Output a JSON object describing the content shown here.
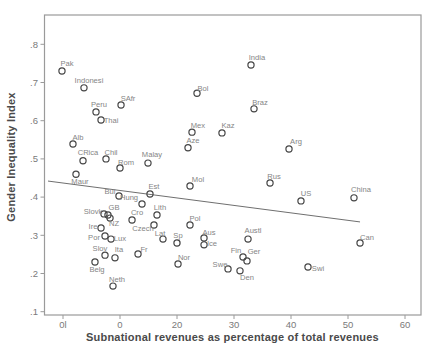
{
  "colors": {
    "background": "#ffffff",
    "frame": "#9a9a9a",
    "tick_text": "#7a7a7a",
    "marker_stroke": "#454545",
    "country_label_text": "#858585",
    "axis_title_text": "#4a4a4a",
    "trend_line": "#6f6f6f"
  },
  "chart_data": {
    "type": "scatter",
    "title": "",
    "xlabel": "Subnational revenues as percentage of total revenues",
    "ylabel": "Gender Inequality Index",
    "xlim": [
      -3.2,
      62.8
    ],
    "ylim": [
      0.09,
      0.88
    ],
    "grid": false,
    "legend": "none",
    "marker_style": "hollow-circle",
    "xticks": [
      {
        "value": 0,
        "label": "0l"
      },
      {
        "value": 10,
        "label": "0"
      },
      {
        "value": 20,
        "label": "20"
      },
      {
        "value": 30,
        "label": "30"
      },
      {
        "value": 40,
        "label": "40"
      },
      {
        "value": 50,
        "label": "50"
      },
      {
        "value": 60,
        "label": "60"
      }
    ],
    "yticks": [
      {
        "value": 0.1,
        "label": ".1"
      },
      {
        "value": 0.2,
        "label": ".2"
      },
      {
        "value": 0.3,
        "label": ".3"
      },
      {
        "value": 0.4,
        "label": ".4"
      },
      {
        "value": 0.5,
        "label": ".5"
      },
      {
        "value": 0.6,
        "label": ".6"
      },
      {
        "value": 0.7,
        "label": ".7"
      },
      {
        "value": 0.8,
        "label": ".8"
      }
    ],
    "trend_line": {
      "x1": -2.63,
      "y1": 0.442,
      "x2": 52.11,
      "y2": 0.335
    },
    "points": [
      {
        "label": "Pak",
        "x": -0.18,
        "y": 0.73,
        "ldx": 5,
        "ldy": -8
      },
      {
        "label": "Indonesi",
        "x": 3.68,
        "y": 0.686,
        "ldx": 5,
        "ldy": -7
      },
      {
        "label": "SAfr",
        "x": 10.18,
        "y": 0.641,
        "ldx": 7,
        "ldy": -7
      },
      {
        "label": "Peru",
        "x": 5.79,
        "y": 0.623,
        "ldx": 3,
        "ldy": -8
      },
      {
        "label": "Thai",
        "x": 6.67,
        "y": 0.602,
        "ldx": 10,
        "ldy": 0
      },
      {
        "label": "Alb",
        "x": 1.75,
        "y": 0.539,
        "ldx": 5,
        "ldy": -7
      },
      {
        "label": "CRica",
        "x": 3.51,
        "y": 0.495,
        "ldx": 5,
        "ldy": -8
      },
      {
        "label": "Chil",
        "x": 7.54,
        "y": 0.5,
        "ldx": 5,
        "ldy": -7
      },
      {
        "label": "Rom",
        "x": 10.0,
        "y": 0.476,
        "ldx": 6,
        "ldy": -6
      },
      {
        "label": "Malay",
        "x": 14.91,
        "y": 0.489,
        "ldx": 4,
        "ldy": -9
      },
      {
        "label": "Maur",
        "x": 2.28,
        "y": 0.46,
        "ldx": 4,
        "ldy": 7
      },
      {
        "label": "Bol",
        "x": 23.51,
        "y": 0.672,
        "ldx": 6,
        "ldy": -5
      },
      {
        "label": "India",
        "x": 32.98,
        "y": 0.746,
        "ldx": 6,
        "ldy": -8
      },
      {
        "label": "Braz",
        "x": 33.51,
        "y": 0.631,
        "ldx": 6,
        "ldy": -6
      },
      {
        "label": "Mex",
        "x": 22.63,
        "y": 0.57,
        "ldx": 6,
        "ldy": -7
      },
      {
        "label": "Kaz",
        "x": 27.89,
        "y": 0.568,
        "ldx": 6,
        "ldy": -8
      },
      {
        "label": "Aze",
        "x": 21.93,
        "y": 0.529,
        "ldx": 5,
        "ldy": -7
      },
      {
        "label": "Arg",
        "x": 39.65,
        "y": 0.526,
        "ldx": 7,
        "ldy": -8
      },
      {
        "label": "Mol",
        "x": 22.28,
        "y": 0.429,
        "ldx": 8,
        "ldy": -7
      },
      {
        "label": "Est",
        "x": 15.26,
        "y": 0.408,
        "ldx": 4,
        "ldy": -8
      },
      {
        "label": "Rus",
        "x": 36.32,
        "y": 0.437,
        "ldx": 4,
        "ldy": -7
      },
      {
        "label": "US",
        "x": 41.75,
        "y": 0.39,
        "ldx": 5,
        "ldy": -8
      },
      {
        "label": "China",
        "x": 51.05,
        "y": 0.398,
        "ldx": 7,
        "ldy": -8
      },
      {
        "label": "Can",
        "x": 52.11,
        "y": 0.28,
        "ldx": 7,
        "ldy": -6
      },
      {
        "label": "Swi",
        "x": 42.98,
        "y": 0.217,
        "ldx": 10,
        "ldy": 1
      },
      {
        "label": "Bul",
        "x": 9.82,
        "y": 0.403,
        "ldx": -9,
        "ldy": -5
      },
      {
        "label": "Hung",
        "x": 13.86,
        "y": 0.382,
        "ldx": -13,
        "ldy": -7
      },
      {
        "label": "Cro",
        "x": 12.11,
        "y": 0.34,
        "ldx": 5,
        "ldy": -8
      },
      {
        "label": "Lith",
        "x": 16.49,
        "y": 0.353,
        "ldx": 3,
        "ldy": -8
      },
      {
        "label": "Slovk",
        "x": 7.19,
        "y": 0.356,
        "ldx": -11,
        "ldy": -3
      },
      {
        "label": "GB",
        "x": 7.89,
        "y": 0.353,
        "ldx": 6,
        "ldy": -8
      },
      {
        "label": "NZ",
        "x": 8.25,
        "y": 0.345,
        "ldx": 4,
        "ldy": 5
      },
      {
        "label": "Ire",
        "x": 6.67,
        "y": 0.319,
        "ldx": -8,
        "ldy": -2
      },
      {
        "label": "Por",
        "x": 7.37,
        "y": 0.298,
        "ldx": -11,
        "ldy": 1
      },
      {
        "label": "Lux",
        "x": 8.42,
        "y": 0.29,
        "ldx": 9,
        "ldy": -1
      },
      {
        "label": "Czech",
        "x": 15.96,
        "y": 0.327,
        "ldx": -11,
        "ldy": 3
      },
      {
        "label": "Lat",
        "x": 17.54,
        "y": 0.29,
        "ldx": -3,
        "ldy": -6
      },
      {
        "label": "Sp",
        "x": 20.0,
        "y": 0.28,
        "ldx": 1,
        "ldy": -8
      },
      {
        "label": "Pol",
        "x": 22.28,
        "y": 0.327,
        "ldx": 5,
        "ldy": -7
      },
      {
        "label": "Aus",
        "x": 24.74,
        "y": 0.293,
        "ldx": 5,
        "ldy": -6
      },
      {
        "label": "Ice",
        "x": 24.74,
        "y": 0.275,
        "ldx": 8,
        "ldy": -1
      },
      {
        "label": "Fr",
        "x": 13.16,
        "y": 0.251,
        "ldx": 6,
        "ldy": -5
      },
      {
        "label": "Slov",
        "x": 7.37,
        "y": 0.248,
        "ldx": -5,
        "ldy": -7
      },
      {
        "label": "Ita",
        "x": 9.12,
        "y": 0.241,
        "ldx": 4,
        "ldy": -8
      },
      {
        "label": "Belg",
        "x": 5.61,
        "y": 0.23,
        "ldx": 2,
        "ldy": 7
      },
      {
        "label": "Neth",
        "x": 8.77,
        "y": 0.167,
        "ldx": 4,
        "ldy": -7
      },
      {
        "label": "Nor",
        "x": 20.18,
        "y": 0.225,
        "ldx": 6,
        "ldy": -7
      },
      {
        "label": "Swe",
        "x": 28.95,
        "y": 0.212,
        "ldx": -8,
        "ldy": -5
      },
      {
        "label": "Fin",
        "x": 31.58,
        "y": 0.243,
        "ldx": -7,
        "ldy": -7
      },
      {
        "label": "Ger",
        "x": 32.28,
        "y": 0.233,
        "ldx": 7,
        "ldy": -9
      },
      {
        "label": "Den",
        "x": 31.05,
        "y": 0.207,
        "ldx": 7,
        "ldy": 7
      },
      {
        "label": "Austl",
        "x": 32.46,
        "y": 0.29,
        "ldx": 5,
        "ldy": -9
      }
    ]
  }
}
